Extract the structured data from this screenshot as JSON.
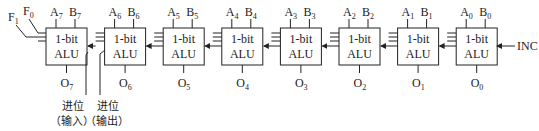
{
  "diagram": {
    "alu_label_line1": "1-bit",
    "alu_label_line2": "ALU",
    "stages": [
      {
        "index": 7,
        "a": "A",
        "a_sub": "7",
        "b": "B",
        "b_sub": "7",
        "o": "O",
        "o_sub": "7"
      },
      {
        "index": 6,
        "a": "A",
        "a_sub": "6",
        "b": "B",
        "b_sub": "6",
        "o": "O",
        "o_sub": "6"
      },
      {
        "index": 5,
        "a": "A",
        "a_sub": "5",
        "b": "B",
        "b_sub": "5",
        "o": "O",
        "o_sub": "5"
      },
      {
        "index": 4,
        "a": "A",
        "a_sub": "4",
        "b": "B",
        "b_sub": "4",
        "o": "O",
        "o_sub": "4"
      },
      {
        "index": 3,
        "a": "A",
        "a_sub": "3",
        "b": "B",
        "b_sub": "3",
        "o": "O",
        "o_sub": "3"
      },
      {
        "index": 2,
        "a": "A",
        "a_sub": "2",
        "b": "B",
        "b_sub": "2",
        "o": "O",
        "o_sub": "2"
      },
      {
        "index": 1,
        "a": "A",
        "a_sub": "1",
        "b": "B",
        "b_sub": "1",
        "o": "O",
        "o_sub": "1"
      },
      {
        "index": 0,
        "a": "A",
        "a_sub": "0",
        "b": "B",
        "b_sub": "0",
        "o": "O",
        "o_sub": "0"
      }
    ],
    "function_inputs": [
      {
        "label": "F",
        "sub": "1"
      },
      {
        "label": "F",
        "sub": "0"
      }
    ],
    "inc_label": "INC",
    "carry_in": {
      "line1": "进位",
      "line2": "（输入）"
    },
    "carry_out": {
      "line1": "进位",
      "line2": "（输出）"
    }
  }
}
